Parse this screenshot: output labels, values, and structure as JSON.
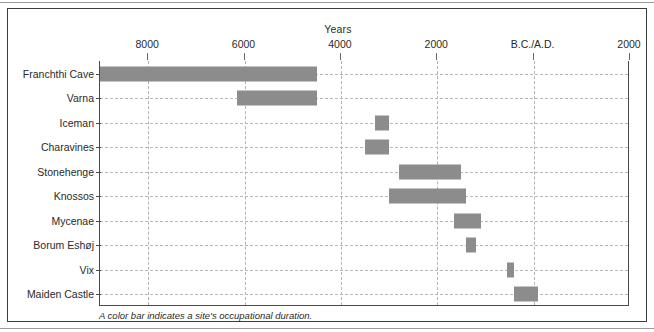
{
  "figure": {
    "title": "Years",
    "caption": "A color bar indicates a site's occupational duration."
  },
  "chart_data": {
    "type": "bar",
    "orientation": "horizontal",
    "title": "Years",
    "xlabel": "Years",
    "ylabel": "",
    "note": "Horizontal timeline (Gantt-style) of archaeological site occupation spans. X axis runs from 9000 B.C. at left to 2000 A.D. at right; negative values are B.C., positive values are A.D.",
    "axis": {
      "tick_labels": [
        "8000",
        "6000",
        "4000",
        "2000",
        "B.C./A.D.",
        "2000"
      ],
      "tick_values": [
        -8000,
        -6000,
        -4000,
        -2000,
        0,
        2000
      ],
      "xlim": [
        -9000,
        2000
      ],
      "grid": true,
      "legend": "none"
    },
    "categories": [
      "Franchthi Cave",
      "Varna",
      "Iceman",
      "Charavines",
      "Stonehenge",
      "Knossos",
      "Mycenae",
      "Borum Eshøj",
      "Vix",
      "Maiden Castle"
    ],
    "bar_color": "#8c8c8c",
    "spans": [
      {
        "label": "Franchthi Cave",
        "start": -9000,
        "end": -4500
      },
      {
        "label": "Varna",
        "start": -6150,
        "end": -4500
      },
      {
        "label": "Iceman",
        "start": -3300,
        "end": -3000
      },
      {
        "label": "Charavines",
        "start": -3500,
        "end": -3000
      },
      {
        "label": "Stonehenge",
        "start": -2800,
        "end": -1500
      },
      {
        "label": "Knossos",
        "start": -3000,
        "end": -1400
      },
      {
        "label": "Mycenae",
        "start": -1650,
        "end": -1100
      },
      {
        "label": "Borum Eshøj",
        "start": -1400,
        "end": -1200
      },
      {
        "label": "Vix",
        "start": -550,
        "end": -400
      },
      {
        "label": "Maiden Castle",
        "start": -400,
        "end": 100
      }
    ]
  },
  "colors": {
    "bar": "#8c8c8c",
    "frame": "#3c3c3c",
    "grid": "#b2b2b2",
    "text": "#2a2a2a",
    "background": "#ffffff"
  }
}
